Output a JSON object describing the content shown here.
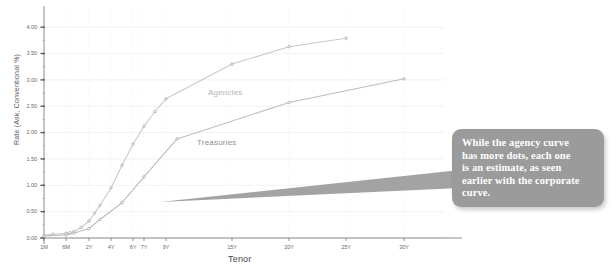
{
  "chart_data": {
    "type": "line",
    "title": "",
    "xlabel": "Tenor",
    "ylabel": "Rate (Ask, Conventional %)",
    "ylim": [
      0.0,
      4.25
    ],
    "yticks": [
      "0.00",
      "0.50",
      "1.00",
      "1.50",
      "2.00",
      "2.50",
      "3.00",
      "3.50",
      "4.00"
    ],
    "ytick_values": [
      0.0,
      0.5,
      1.0,
      1.5,
      2.0,
      2.5,
      3.0,
      3.5,
      4.0
    ],
    "xticks": [
      "1M",
      "6M",
      "2Y",
      "4Y",
      "6Y",
      "7Y",
      "9Y",
      "15Y",
      "20Y",
      "25Y",
      "30Y"
    ],
    "xtick_values": [
      0.083,
      0.5,
      2,
      4,
      6,
      7,
      9,
      15,
      20,
      25,
      30
    ],
    "grid": true,
    "legend_position": "inline-annotation",
    "series": [
      {
        "name": "Agencies",
        "color": "#c9c9c9",
        "marker": "dot",
        "x": [
          0.083,
          0.25,
          0.5,
          0.75,
          1,
          1.5,
          2,
          2.5,
          3,
          4,
          5,
          6,
          7,
          8,
          9,
          15,
          20,
          25
        ],
        "y": [
          0.05,
          0.07,
          0.09,
          0.1,
          0.12,
          0.2,
          0.32,
          0.47,
          0.62,
          0.95,
          1.38,
          1.78,
          2.12,
          2.4,
          2.64,
          3.3,
          3.63,
          3.79
        ]
      },
      {
        "name": "Treasuries",
        "color": "#bdbdbd",
        "marker": "dot",
        "x": [
          0.083,
          0.5,
          1,
          2,
          3,
          5,
          7,
          10,
          20,
          30
        ],
        "y": [
          0.04,
          0.06,
          0.09,
          0.18,
          0.35,
          0.67,
          1.16,
          1.88,
          2.57,
          3.02
        ]
      }
    ],
    "annotations": [
      {
        "name": "Agencies",
        "x": 9,
        "y": 2.64
      },
      {
        "name": "Treasuries",
        "x": 10,
        "y": 1.88
      }
    ]
  },
  "callout": {
    "text": "While the agency curve\nhas more dots, each one\nis an estimate, as seen\nearlier with the corporate\ncurve.",
    "bg_color": "#9b9b9b",
    "text_color": "#ffffff"
  },
  "colors": {
    "agencies": "#c9c9c9",
    "treasuries": "#bdbdbd",
    "axis": "#808080",
    "grid": "#ededf2",
    "tick_text": "#6b6b6b",
    "callout_bg": "#9b9b9b"
  }
}
